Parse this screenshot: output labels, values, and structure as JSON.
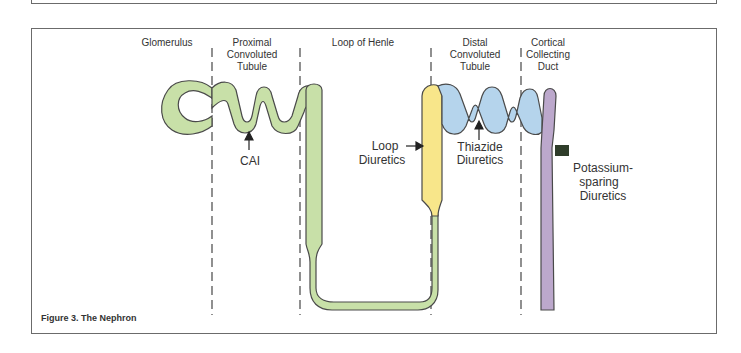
{
  "figure": {
    "caption": "Figure 3. The Nephron",
    "segments": [
      {
        "label_lines": [
          "Glomerulus"
        ]
      },
      {
        "label_lines": [
          "Proximal",
          "Convoluted",
          "Tubule"
        ]
      },
      {
        "label_lines": [
          "Loop of Henle"
        ]
      },
      {
        "label_lines": [
          "Distal",
          "Convoluted",
          "Tubule"
        ]
      },
      {
        "label_lines": [
          "Cortical",
          "Collecting",
          "Duct"
        ]
      }
    ],
    "annotations": [
      {
        "label_lines": [
          "CAI"
        ]
      },
      {
        "label_lines": [
          "Loop",
          "Diuretics"
        ]
      },
      {
        "label_lines": [
          "Thiazide",
          "Diuretics"
        ]
      },
      {
        "label_lines": [
          "Potassium-",
          "sparing",
          "Diuretics"
        ]
      }
    ],
    "colors": {
      "proximal_green": "#c8e0a8",
      "loop_yellow": "#f8e68a",
      "distal_blue": "#b5d4ec",
      "collecting_purple": "#bca8cc",
      "blocker_dark_green": "#2f3d2a",
      "outline": "#4a4a4a"
    }
  }
}
